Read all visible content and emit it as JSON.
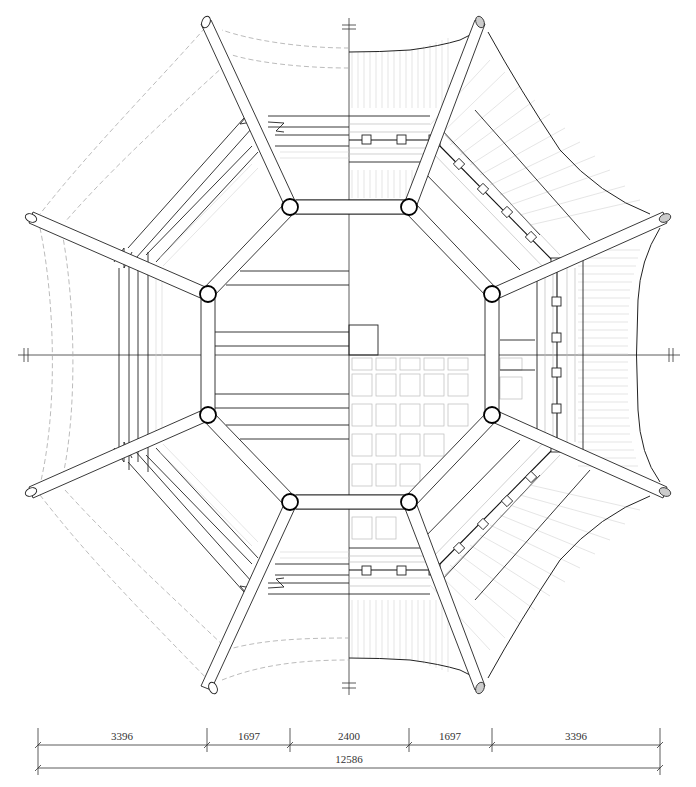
{
  "drawing": {
    "type": "octagonal pavilion plan",
    "left_half": "framing plan (beams, rafters, column grid)",
    "right_half": "roof plan (tile courses, eaves, ceiling grid)",
    "colors": {
      "line": "#222222",
      "light_line": "#bbbbbb",
      "dashed": "#aaaaaa",
      "background": "#ffffff"
    }
  },
  "dimensions": {
    "segments": [
      {
        "label": "3396",
        "x_start": 38,
        "x_end": 207
      },
      {
        "label": "1697",
        "x_start": 207,
        "x_end": 290
      },
      {
        "label": "2400",
        "x_start": 290,
        "x_end": 409
      },
      {
        "label": "1697",
        "x_start": 409,
        "x_end": 492
      },
      {
        "label": "3396",
        "x_start": 492,
        "x_end": 660
      }
    ],
    "total": {
      "label": "12586",
      "x_start": 38,
      "x_end": 660
    }
  },
  "axis_markers": {
    "top": "axis-marker",
    "bottom": "axis-marker",
    "left": "axis-marker",
    "right": "axis-marker"
  }
}
